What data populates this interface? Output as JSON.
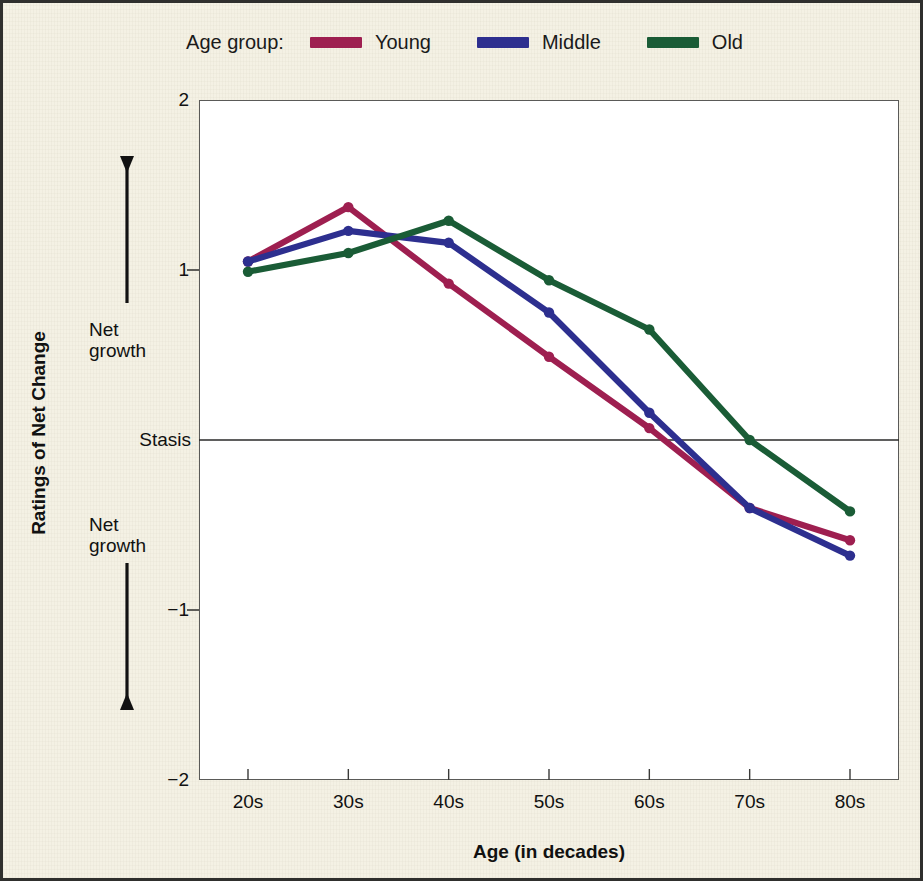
{
  "legend": {
    "title": "Age group:",
    "entries": [
      {
        "label": "Young",
        "color": "#9e1f50"
      },
      {
        "label": "Middle",
        "color": "#2d2f8f"
      },
      {
        "label": "Old",
        "color": "#1a5c36"
      }
    ]
  },
  "axes": {
    "y_title": "Ratings of Net Change",
    "x_title": "Age (in decades)",
    "y_tick_labels": [
      "2",
      "1",
      "−1",
      "−2"
    ],
    "stasis_label": "Stasis",
    "net_growth_up": "Net\ngrowth",
    "net_growth_down": "Net\ngrowth",
    "x_tick_labels": [
      "20s",
      "30s",
      "40s",
      "50s",
      "60s",
      "70s",
      "80s"
    ]
  },
  "chart_data": {
    "type": "line",
    "title": "",
    "xlabel": "Age (in decades)",
    "ylabel": "Ratings of Net Change",
    "categories": [
      "20s",
      "30s",
      "40s",
      "50s",
      "60s",
      "70s",
      "80s"
    ],
    "ylim": [
      -2,
      2
    ],
    "yticks": [
      2,
      1,
      0,
      -1,
      -2
    ],
    "ytick_labels": [
      "2",
      "1",
      "Stasis",
      "−1",
      "−2"
    ],
    "grid": false,
    "reference_line": {
      "value": 0,
      "label": "Stasis"
    },
    "legend_position": "top-center",
    "legend_title": "Age group:",
    "series": [
      {
        "name": "Young",
        "color": "#9e1f50",
        "values": [
          1.05,
          1.37,
          0.92,
          0.49,
          0.07,
          -0.4,
          -0.59
        ]
      },
      {
        "name": "Middle",
        "color": "#2d2f8f",
        "values": [
          1.05,
          1.23,
          1.16,
          0.75,
          0.16,
          -0.4,
          -0.68
        ]
      },
      {
        "name": "Old",
        "color": "#1a5c36",
        "values": [
          0.99,
          1.1,
          1.29,
          0.94,
          0.65,
          0.0,
          -0.42
        ]
      }
    ],
    "annotations": [
      {
        "text": "Net growth",
        "position": "upper-left-outside",
        "arrow": "up"
      },
      {
        "text": "Net growth",
        "position": "lower-left-outside",
        "arrow": "down"
      }
    ]
  }
}
